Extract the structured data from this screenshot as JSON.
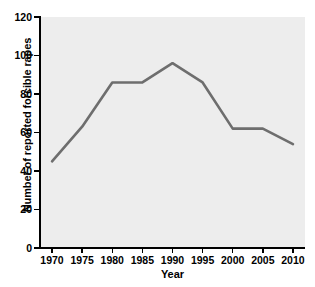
{
  "chart_data": {
    "type": "line",
    "title": "",
    "xlabel": "Year",
    "ylabel": "Number of reported forcible rapes",
    "x": [
      1970,
      1975,
      1980,
      1985,
      1990,
      1995,
      2000,
      2005,
      2010
    ],
    "values": [
      45,
      63,
      86,
      86,
      96,
      86,
      62,
      62,
      54
    ],
    "series": [
      {
        "name": "Reported forcible rapes",
        "values": [
          45,
          63,
          86,
          86,
          96,
          86,
          62,
          62,
          54
        ]
      }
    ],
    "xtick_labels": [
      "1970",
      "1975",
      "1980",
      "1985",
      "1990",
      "1995",
      "2000",
      "2005",
      "2010"
    ],
    "ytick_labels": [
      "0",
      "20",
      "40",
      "60",
      "80",
      "100",
      "120"
    ],
    "yticks": [
      0,
      20,
      40,
      60,
      80,
      100,
      120
    ],
    "xlim": [
      1968,
      2012
    ],
    "ylim": [
      0,
      120
    ],
    "grid": false,
    "legend": false,
    "markers": false,
    "line_color": "#6e6e6e",
    "panel_color": "#ededed",
    "figure_color": "#ffffff",
    "axis_color": "#000000",
    "text_color": "#000000"
  }
}
